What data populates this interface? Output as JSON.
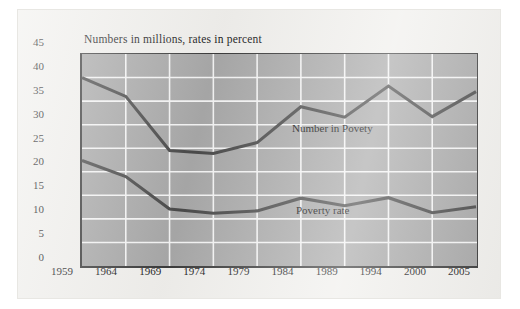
{
  "figure": {
    "title": "Numbers in millions, rates in percent",
    "background_color": "#f0efec",
    "plot_background_color": "#a8a8a8",
    "grid_color": "#f4f4f4",
    "line_color": "#4a4a4a",
    "axis_color": "#3b3b3b"
  },
  "chart_data": {
    "type": "line",
    "title": "Numbers in millions, rates in percent",
    "xlabel": "",
    "ylabel": "",
    "ylim": [
      0,
      45
    ],
    "yticks": [
      0,
      5,
      10,
      15,
      20,
      25,
      30,
      35,
      40,
      45
    ],
    "categories": [
      "1959",
      "1964",
      "1969",
      "1974",
      "1979",
      "1984",
      "1989",
      "1994",
      "2000",
      "2005"
    ],
    "grid": true,
    "legend_position": "inline-annotation",
    "series": [
      {
        "name": "Number in Povety",
        "values": [
          40.0,
          36.0,
          24.5,
          23.9,
          26.2,
          33.8,
          31.6,
          38.2,
          31.7,
          37.0
        ]
      },
      {
        "name": "Poverty rate",
        "values": [
          22.4,
          19.0,
          12.1,
          11.2,
          11.7,
          14.4,
          12.8,
          14.5,
          11.3,
          12.6
        ]
      }
    ],
    "annotations": [
      {
        "text": "Number in Povety",
        "x_px": 292,
        "y_px": 122
      },
      {
        "text": "Poverty rate",
        "x_px": 296,
        "y_px": 204
      }
    ]
  }
}
